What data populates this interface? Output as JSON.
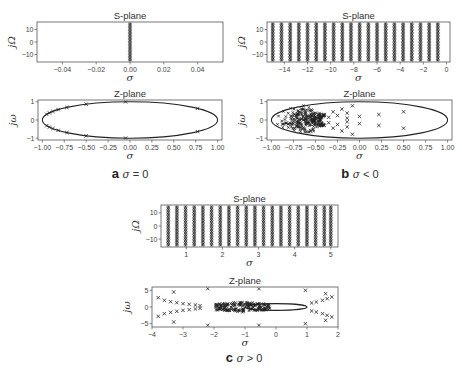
{
  "figure": {
    "panels": [
      {
        "id": "a",
        "caption_letter": "a",
        "caption_var": "σ",
        "caption_rel": " = 0",
        "s_plane": {
          "title": "S-plane",
          "xlabel": "σ",
          "ylabel": "jΩ",
          "xticks": [
            "-0.04",
            "-0.02",
            "0.00",
            "0.02",
            "0.04"
          ],
          "yticks": [
            "10",
            "0",
            "-10"
          ]
        },
        "z_plane": {
          "title": "Z-plane",
          "xlabel": "σ",
          "ylabel": "jω",
          "xticks": [
            "-1.00",
            "-0.75",
            "-0.50",
            "-0.25",
            "0.00",
            "0.25",
            "0.50",
            "0.75",
            "1.00"
          ],
          "yticks": [
            "1",
            "0",
            "-1"
          ]
        }
      },
      {
        "id": "b",
        "caption_letter": "b",
        "caption_var": "σ",
        "caption_rel": " < 0",
        "s_plane": {
          "title": "S-plane",
          "xlabel": "σ",
          "ylabel": "jΩ",
          "xticks": [
            "-14",
            "-12",
            "-10",
            "-8",
            "-6",
            "-4",
            "-2",
            "0"
          ],
          "yticks": [
            "10",
            "0",
            "-10"
          ]
        },
        "z_plane": {
          "title": "Z-plane",
          "xlabel": "σ",
          "ylabel": "jω",
          "xticks": [
            "-1.00",
            "-0.75",
            "-0.50",
            "-0.25",
            "0.00",
            "0.25",
            "0.50",
            "0.75",
            "1.00"
          ],
          "yticks": [
            "1",
            "0",
            "-1"
          ]
        }
      },
      {
        "id": "c",
        "caption_letter": "c",
        "caption_var": "σ",
        "caption_rel": " > 0",
        "s_plane": {
          "title": "S-plane",
          "xlabel": "σ",
          "ylabel": "jΩ",
          "xticks": [
            "1",
            "2",
            "3",
            "4",
            "5"
          ],
          "yticks": [
            "10",
            "0",
            "-10"
          ]
        },
        "z_plane": {
          "title": "Z-plane",
          "xlabel": "σ",
          "ylabel": "jω",
          "xticks": [
            "-4",
            "-3",
            "-2",
            "-1",
            "0",
            "1",
            "2"
          ],
          "yticks": [
            "5",
            "0",
            "-5"
          ]
        }
      }
    ]
  },
  "chart_data": [
    {
      "type": "scatter",
      "panel": "a",
      "title": "S-plane",
      "xlabel": "σ",
      "ylabel": "jΩ",
      "xlim": [
        -0.055,
        0.055
      ],
      "ylim": [
        -16,
        16
      ],
      "description": "Single dense vertical column of x markers at σ = 0 spanning jΩ from about -15 to 15",
      "columns_sigma": [
        0.0
      ]
    },
    {
      "type": "scatter",
      "panel": "a",
      "title": "Z-plane",
      "xlabel": "σ",
      "ylabel": "jω",
      "xlim": [
        -1.05,
        1.05
      ],
      "ylim": [
        -1.1,
        1.1
      ],
      "description": "Points lie on the unit circle (shown as ellipse due to aspect)",
      "points": [
        [
          -0.05,
          1.0
        ],
        [
          -0.05,
          -1.0
        ],
        [
          0.77,
          0.64
        ],
        [
          0.77,
          -0.64
        ],
        [
          -0.5,
          0.87
        ],
        [
          -0.5,
          -0.87
        ],
        [
          -0.72,
          0.69
        ],
        [
          -0.72,
          -0.69
        ],
        [
          -0.82,
          0.57
        ],
        [
          -0.82,
          -0.57
        ],
        [
          -0.88,
          0.47
        ],
        [
          -0.88,
          -0.47
        ],
        [
          -0.92,
          0.39
        ],
        [
          -0.92,
          -0.39
        ],
        [
          -0.95,
          0.31
        ],
        [
          -0.95,
          -0.31
        ]
      ]
    },
    {
      "type": "scatter",
      "panel": "b",
      "title": "S-plane",
      "xlabel": "σ",
      "ylabel": "jΩ",
      "xlim": [
        -15.5,
        0.3
      ],
      "ylim": [
        -16,
        16
      ],
      "description": "Regularly spaced vertical columns of x markers from σ ≈ -15 to σ ≈ -0.5",
      "columns_sigma": [
        -15.0,
        -14.25,
        -13.5,
        -12.75,
        -12.0,
        -11.25,
        -10.5,
        -9.75,
        -9.0,
        -8.25,
        -7.5,
        -6.75,
        -6.0,
        -5.25,
        -4.5,
        -3.75,
        -3.0,
        -2.25,
        -1.5,
        -0.75
      ]
    },
    {
      "type": "scatter",
      "panel": "b",
      "title": "Z-plane",
      "xlabel": "σ",
      "ylabel": "jω",
      "xlim": [
        -1.05,
        1.05
      ],
      "ylim": [
        -1.1,
        1.1
      ],
      "description": "Points inside unit circle, densely clustered near -1, sparse toward 0.5",
      "points": [
        [
          0.5,
          0.45
        ],
        [
          0.5,
          -0.45
        ],
        [
          0.22,
          0.3
        ],
        [
          0.22,
          -0.3
        ],
        [
          0.0,
          0.2
        ],
        [
          0.0,
          -0.2
        ],
        [
          -0.08,
          0.78
        ],
        [
          -0.08,
          -0.78
        ],
        [
          -0.14,
          0.38
        ],
        [
          -0.14,
          -0.38
        ],
        [
          -0.14,
          0.1
        ],
        [
          -0.14,
          -0.1
        ],
        [
          -0.2,
          0.6
        ],
        [
          -0.2,
          -0.6
        ],
        [
          -0.25,
          0.25
        ],
        [
          -0.25,
          -0.25
        ],
        [
          -0.3,
          0.45
        ],
        [
          -0.3,
          -0.45
        ],
        [
          -0.35,
          0.15
        ],
        [
          -0.35,
          -0.15
        ],
        [
          -0.4,
          0.3
        ],
        [
          -0.4,
          -0.3
        ]
      ]
    },
    {
      "type": "scatter",
      "panel": "c",
      "title": "S-plane",
      "xlabel": "σ",
      "ylabel": "jΩ",
      "xlim": [
        0.3,
        5.2
      ],
      "ylim": [
        -16,
        16
      ],
      "description": "Regularly spaced vertical columns of x markers from σ ≈ 0.5 to σ ≈ 5",
      "columns_sigma": [
        0.5,
        0.74,
        0.98,
        1.22,
        1.46,
        1.7,
        1.94,
        2.18,
        2.42,
        2.66,
        2.9,
        3.14,
        3.38,
        3.62,
        3.86,
        4.1,
        4.34,
        4.58,
        4.82,
        5.0
      ]
    },
    {
      "type": "scatter",
      "panel": "c",
      "title": "Z-plane",
      "xlabel": "σ",
      "ylabel": "jω",
      "xlim": [
        -4.0,
        2.0
      ],
      "ylim": [
        -6,
        6
      ],
      "description": "Points both inside and outside unit circle; dense cluster between -2 and -0.2, outliers out to -3.8 and 1.9",
      "points": [
        [
          -3.3,
          4.5
        ],
        [
          -3.3,
          -4.5
        ],
        [
          -2.2,
          5.5
        ],
        [
          -2.2,
          -5.5
        ],
        [
          -0.55,
          5.5
        ],
        [
          -0.55,
          -5.5
        ],
        [
          0.95,
          5.0
        ],
        [
          0.95,
          -5.0
        ],
        [
          -3.8,
          2.8
        ],
        [
          -3.8,
          -2.8
        ],
        [
          -3.6,
          2.0
        ],
        [
          -3.6,
          -2.0
        ],
        [
          -3.4,
          1.6
        ],
        [
          -3.4,
          -1.6
        ],
        [
          -3.2,
          1.3
        ],
        [
          -3.2,
          -1.3
        ],
        [
          -3.0,
          1.0
        ],
        [
          -3.0,
          -1.0
        ],
        [
          -2.8,
          0.8
        ],
        [
          -2.8,
          -0.8
        ],
        [
          -2.6,
          0.6
        ],
        [
          -2.6,
          -0.6
        ],
        [
          -2.45,
          0.4
        ],
        [
          -2.45,
          -0.4
        ],
        [
          1.15,
          1.2
        ],
        [
          1.15,
          -1.2
        ],
        [
          1.3,
          1.5
        ],
        [
          1.3,
          -1.5
        ],
        [
          1.5,
          2.0
        ],
        [
          1.5,
          -2.0
        ],
        [
          1.65,
          2.5
        ],
        [
          1.65,
          -2.5
        ],
        [
          1.8,
          3.0
        ],
        [
          1.8,
          -3.0
        ],
        [
          1.6,
          4.0
        ],
        [
          1.6,
          -4.0
        ]
      ]
    }
  ]
}
